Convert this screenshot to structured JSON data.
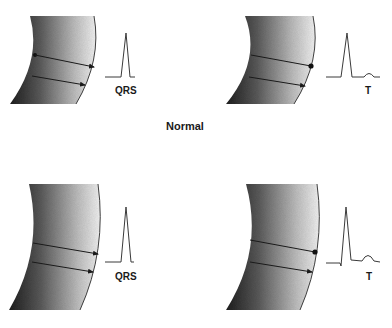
{
  "figure": {
    "caption": "Normal",
    "panels": [
      {
        "id": "top-left",
        "row": "normal",
        "description": "myocardial wall segment with two depolarization arrows, endocardial dot",
        "waveform_label": "QRS",
        "waveform": "QRS complex"
      },
      {
        "id": "top-right",
        "row": "normal",
        "description": "myocardial wall segment with two repolarization arrows, epicardial dot",
        "waveform_label": "T",
        "waveform": "QRS complex followed by small upright T wave"
      },
      {
        "id": "bottom-left",
        "row": "second",
        "description": "myocardial wall segment with two depolarization arrows",
        "waveform_label": "QRS",
        "waveform": "QRS complex"
      },
      {
        "id": "bottom-right",
        "row": "second",
        "description": "myocardial wall segment with two repolarization arrows, epicardial dot",
        "waveform_label": "T",
        "waveform": "QRS complex followed by upright T wave"
      }
    ]
  },
  "colors": {
    "tissue_dark": "#1e1e1e",
    "tissue_light": "#f2f2f2",
    "line": "#1a1a1a",
    "waveform": "#3a3a3a",
    "background": "#ffffff"
  }
}
